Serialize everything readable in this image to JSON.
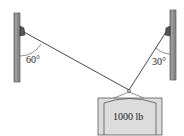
{
  "diagram": {
    "left_angle_label": "60°",
    "right_angle_label": "30°",
    "weight_label": "1000 lb"
  },
  "colors": {
    "post": "#8a8a8a",
    "post_dark": "#555555",
    "cable": "#333333",
    "block_fill": "#dcdcdc",
    "block_stroke": "#444444"
  }
}
